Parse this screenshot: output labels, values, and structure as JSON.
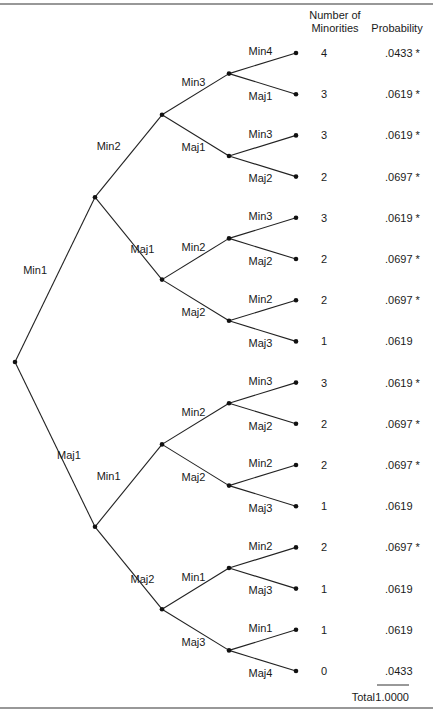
{
  "header": {
    "col1_line1": "Number of",
    "col1_line2": "Minorities",
    "col2": "Probability"
  },
  "total": {
    "label": "Total",
    "value": "1.0000"
  },
  "tree": {
    "level1": [
      "Min1",
      "Maj1"
    ],
    "level2": [
      "Min2",
      "Maj1",
      "Min1",
      "Maj2"
    ],
    "level3": [
      "Min3",
      "Maj1",
      "Min2",
      "Maj2",
      "Min2",
      "Maj2",
      "Min1",
      "Maj3"
    ],
    "level4": [
      "Min4",
      "Maj1",
      "Min3",
      "Maj2",
      "Min3",
      "Maj2",
      "Min2",
      "Maj3",
      "Min3",
      "Maj2",
      "Min2",
      "Maj3",
      "Min2",
      "Maj3",
      "Min1",
      "Maj4"
    ]
  },
  "leaves": [
    {
      "minorities": "4",
      "probability": ".0433 *"
    },
    {
      "minorities": "3",
      "probability": ".0619 *"
    },
    {
      "minorities": "3",
      "probability": ".0619 *"
    },
    {
      "minorities": "2",
      "probability": ".0697 *"
    },
    {
      "minorities": "3",
      "probability": ".0619 *"
    },
    {
      "minorities": "2",
      "probability": ".0697 *"
    },
    {
      "minorities": "2",
      "probability": ".0697 *"
    },
    {
      "minorities": "1",
      "probability": ".0619"
    },
    {
      "minorities": "3",
      "probability": ".0619 *"
    },
    {
      "minorities": "2",
      "probability": ".0697 *"
    },
    {
      "minorities": "2",
      "probability": ".0697 *"
    },
    {
      "minorities": "1",
      "probability": ".0619"
    },
    {
      "minorities": "2",
      "probability": ".0697 *"
    },
    {
      "minorities": "1",
      "probability": ".0619"
    },
    {
      "minorities": "1",
      "probability": ".0619"
    },
    {
      "minorities": "0",
      "probability": ".0433"
    }
  ]
}
